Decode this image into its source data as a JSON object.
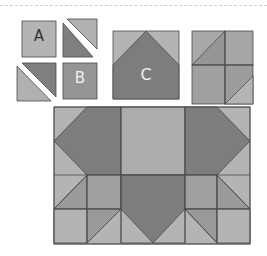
{
  "diagram": {
    "type": "quilt-block-assembly",
    "colors": {
      "light": "#b4b4b4",
      "medium": "#9a9a9a",
      "dark": "#7d7d7d",
      "line": "#4a4a4a",
      "label_dark": "#333333",
      "label_light": "#f0f0f0"
    },
    "units": {
      "A": {
        "label": "A",
        "description": "light square"
      },
      "B": {
        "label": "B",
        "description": "medium square"
      },
      "C": {
        "label": "C",
        "description": "dark pentagon on light background (flying geese point)"
      },
      "hst_pair_1": {
        "description": "half-square triangle pieces, separated"
      },
      "hst_pair_2": {
        "description": "half-square triangle pieces, separated"
      },
      "four_patch": {
        "description": "2x2 assembled unit with half-square triangles"
      }
    },
    "assembled_block": {
      "description": "Full quilt block combining C units and four-patch units",
      "columns": 6,
      "rows": 3
    }
  }
}
